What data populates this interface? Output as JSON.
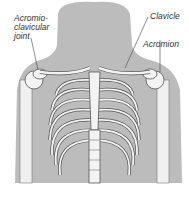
{
  "diagram": {
    "labels": {
      "ac_joint": [
        "Acromio-",
        "clavicular",
        "joint"
      ],
      "clavicle": "Clavicle",
      "acromion": "Acromion"
    },
    "colors": {
      "silhouette": "#bcbcbc",
      "bone": "#f3f3f3",
      "outline": "#555555",
      "background": "#ffffff"
    }
  }
}
